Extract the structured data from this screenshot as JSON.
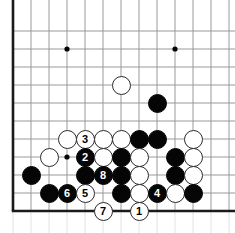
{
  "diagram": {
    "kind": "go-board-diagram",
    "board": {
      "cols": 13,
      "rows": 11,
      "origin_x": 13,
      "origin_y": 31,
      "spacing": 18,
      "line_color": "#9a9a9a",
      "edge_color": "#1a1a1a",
      "background_color": "#ffffff",
      "edges": {
        "left": true,
        "bottom": true,
        "top": false,
        "right": false
      }
    },
    "star_points": [
      {
        "col": 3,
        "row": 1
      },
      {
        "col": 9,
        "row": 1
      },
      {
        "col": 3,
        "row": 7
      }
    ],
    "colors": {
      "black_stone": "#050505",
      "white_stone": "#ffffff",
      "white_stone_outline": "#2b2b2b",
      "black_label_text": "#ffffff",
      "white_label_text": "#000000"
    },
    "stone_radius": 9.5,
    "label_font_size": 11,
    "stones": [
      {
        "id": "w-c6r3",
        "color": "white",
        "col": 6,
        "row": 3,
        "label": ""
      },
      {
        "id": "b-c8r4",
        "color": "black",
        "col": 8,
        "row": 4,
        "label": ""
      },
      {
        "id": "w-c3r6",
        "color": "white",
        "col": 3,
        "row": 6,
        "label": ""
      },
      {
        "id": "w-c4r6",
        "color": "white",
        "col": 4,
        "row": 6,
        "label": "3"
      },
      {
        "id": "w-c5r6",
        "color": "white",
        "col": 5,
        "row": 6,
        "label": ""
      },
      {
        "id": "w-c6r6",
        "color": "white",
        "col": 6,
        "row": 6,
        "label": ""
      },
      {
        "id": "b-c7r6",
        "color": "black",
        "col": 7,
        "row": 6,
        "label": ""
      },
      {
        "id": "b-c8r6",
        "color": "black",
        "col": 8,
        "row": 6,
        "label": ""
      },
      {
        "id": "w-c10r6",
        "color": "white",
        "col": 10,
        "row": 6,
        "label": ""
      },
      {
        "id": "w-c2r7",
        "color": "white",
        "col": 2,
        "row": 7,
        "label": ""
      },
      {
        "id": "b-c4r7",
        "color": "black",
        "col": 4,
        "row": 7,
        "label": "2"
      },
      {
        "id": "w-c5r7",
        "color": "white",
        "col": 5,
        "row": 7,
        "label": ""
      },
      {
        "id": "b-c6r7",
        "color": "black",
        "col": 6,
        "row": 7,
        "label": ""
      },
      {
        "id": "w-c7r7",
        "color": "white",
        "col": 7,
        "row": 7,
        "label": ""
      },
      {
        "id": "b-c9r7",
        "color": "black",
        "col": 9,
        "row": 7,
        "label": ""
      },
      {
        "id": "w-c10r7",
        "color": "white",
        "col": 10,
        "row": 7,
        "label": ""
      },
      {
        "id": "b-c1r8",
        "color": "black",
        "col": 1,
        "row": 8,
        "label": ""
      },
      {
        "id": "b-c4r8",
        "color": "black",
        "col": 4,
        "row": 8,
        "label": ""
      },
      {
        "id": "b-c5r8",
        "color": "black",
        "col": 5,
        "row": 8,
        "label": "8"
      },
      {
        "id": "b-c6r8",
        "color": "black",
        "col": 6,
        "row": 8,
        "label": ""
      },
      {
        "id": "w-c7r8",
        "color": "white",
        "col": 7,
        "row": 8,
        "label": ""
      },
      {
        "id": "b-c9r8",
        "color": "black",
        "col": 9,
        "row": 8,
        "label": ""
      },
      {
        "id": "w-c10r8",
        "color": "white",
        "col": 10,
        "row": 8,
        "label": ""
      },
      {
        "id": "b-c2r9",
        "color": "black",
        "col": 2,
        "row": 9,
        "label": ""
      },
      {
        "id": "b-c3r9",
        "color": "black",
        "col": 3,
        "row": 9,
        "label": "6"
      },
      {
        "id": "w-c4r9",
        "color": "white",
        "col": 4,
        "row": 9,
        "label": "5"
      },
      {
        "id": "b-c6r9",
        "color": "black",
        "col": 6,
        "row": 9,
        "label": ""
      },
      {
        "id": "w-c7r9",
        "color": "white",
        "col": 7,
        "row": 9,
        "label": ""
      },
      {
        "id": "b-c8r9",
        "color": "black",
        "col": 8,
        "row": 9,
        "label": "4"
      },
      {
        "id": "w-c9r9",
        "color": "white",
        "col": 9,
        "row": 9,
        "label": ""
      },
      {
        "id": "b-c10r9",
        "color": "black",
        "col": 10,
        "row": 9,
        "label": ""
      },
      {
        "id": "w-c5r10",
        "color": "white",
        "col": 5,
        "row": 10,
        "label": "7"
      },
      {
        "id": "w-c7r10",
        "color": "white",
        "col": 7,
        "row": 10,
        "label": "1"
      }
    ],
    "move_sequence": [
      {
        "number": "1",
        "color": "white"
      },
      {
        "number": "2",
        "color": "black"
      },
      {
        "number": "3",
        "color": "white"
      },
      {
        "number": "4",
        "color": "black"
      },
      {
        "number": "5",
        "color": "white"
      },
      {
        "number": "6",
        "color": "black"
      },
      {
        "number": "7",
        "color": "white"
      },
      {
        "number": "8",
        "color": "black"
      }
    ]
  }
}
